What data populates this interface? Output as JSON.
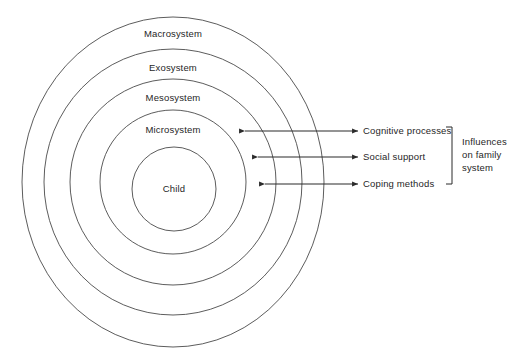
{
  "diagram": {
    "type": "concentric-ellipse-diagram",
    "colors": {
      "background": "#ffffff",
      "ring_stroke": "#4a4a4a",
      "arrow_stroke": "#2b2b2b",
      "text": "#1f1f1f"
    },
    "rings": [
      {
        "label": "Macrosystem",
        "level": 1,
        "label_x": 173,
        "label_y": 34,
        "cx": 173,
        "cy": 182,
        "rx": 151,
        "ry": 165
      },
      {
        "label": "Exosystem",
        "level": 2,
        "label_x": 173,
        "label_y": 68,
        "cx": 173,
        "cy": 182,
        "rx": 129,
        "ry": 133
      },
      {
        "label": "Mesosystem",
        "level": 3,
        "label_x": 173,
        "label_y": 98,
        "cx": 173,
        "cy": 182,
        "rx": 103,
        "ry": 103
      },
      {
        "label": "Microsystem",
        "level": 4,
        "label_x": 173,
        "label_y": 130,
        "cx": 173,
        "cy": 182,
        "rx": 73,
        "ry": 72
      }
    ],
    "center": {
      "label": "Child",
      "cx": 174,
      "cy": 189,
      "r": 42,
      "label_x": 174,
      "label_y": 192
    },
    "influences": [
      {
        "label": "Cognitive processes",
        "arrow_left_x": 245,
        "arrow_right_x": 358,
        "y": 131,
        "label_x": 363,
        "label_y": 134
      },
      {
        "label": "Social support",
        "arrow_left_x": 258,
        "arrow_right_x": 358,
        "y": 157,
        "label_x": 363,
        "label_y": 160
      },
      {
        "label": "Coping methods",
        "arrow_left_x": 265,
        "arrow_right_x": 358,
        "y": 184,
        "label_x": 363,
        "label_y": 187
      }
    ],
    "bracket": {
      "x": 452,
      "top_y": 127,
      "bottom_y": 184,
      "tick_length": 6,
      "lines": [
        "Influences",
        "on family",
        "system"
      ],
      "text_x": 462,
      "line_start_y": 141,
      "line_height": 13
    }
  }
}
